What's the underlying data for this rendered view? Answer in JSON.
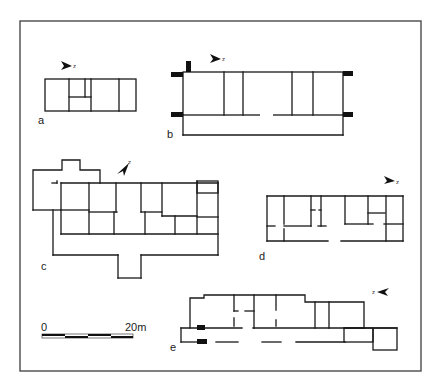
{
  "figure": {
    "plans": [
      {
        "id": "a",
        "label": "a",
        "north_label": "z",
        "north_icon": "north-arrow-icon"
      },
      {
        "id": "b",
        "label": "b",
        "north_label": "z",
        "north_icon": "north-arrow-icon"
      },
      {
        "id": "c",
        "label": "c",
        "north_label": "z",
        "north_icon": "north-arrow-icon"
      },
      {
        "id": "d",
        "label": "d",
        "north_label": "z",
        "north_icon": "north-arrow-icon"
      },
      {
        "id": "e",
        "label": "e",
        "north_label": "z",
        "north_icon": "north-arrow-icon"
      }
    ],
    "scale_bar": {
      "start_label": "0",
      "end_label": "20m",
      "segments": 4
    },
    "colors": {
      "wall": "#1a1a1a",
      "frame": "#4a4a4a",
      "background": "#ffffff"
    }
  }
}
